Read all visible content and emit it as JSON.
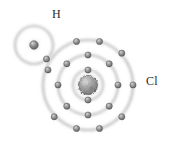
{
  "diagram": {
    "type": "bohr-model",
    "background_color": "#ffffff",
    "width": 178,
    "height": 146,
    "labels": {
      "hydrogen": "H",
      "chlorine": "Cl",
      "label_color": "#2a2a2a",
      "label_font_size": 12
    },
    "atoms": [
      {
        "id": "hydrogen",
        "symbol": "H",
        "center": {
          "x": 34,
          "y": 45
        },
        "nucleus": {
          "radius": 4.2,
          "fill": "#8e8e8e",
          "highlight": "#c9c9c9",
          "edge": "#5d5d5d"
        },
        "shells": [
          {
            "name": "K",
            "radius": 19,
            "electron_count": 1,
            "electrons": [
              {
                "x": 46.5,
                "y": 59.0,
                "shared": true
              }
            ]
          }
        ]
      },
      {
        "id": "chlorine",
        "symbol": "Cl",
        "center": {
          "x": 88,
          "y": 85
        },
        "nucleus": {
          "radius": 9.5,
          "fill": "#9a9a9a",
          "highlight": "#cfcfcf",
          "edge": "#5a5a5a"
        },
        "shells": [
          {
            "name": "K",
            "radius": 15,
            "electron_count": 2,
            "electrons": [
              {
                "x": 88,
                "y": 70,
                "shared": false
              },
              {
                "x": 88,
                "y": 100,
                "shared": false
              }
            ]
          },
          {
            "name": "L",
            "radius": 30,
            "electron_count": 8,
            "electrons": [
              {
                "x": 88,
                "y": 55,
                "shared": false
              },
              {
                "x": 109.2,
                "y": 63.8,
                "shared": false
              },
              {
                "x": 118,
                "y": 85,
                "shared": false
              },
              {
                "x": 109.2,
                "y": 106.2,
                "shared": false
              },
              {
                "x": 88,
                "y": 115,
                "shared": false
              },
              {
                "x": 66.8,
                "y": 106.2,
                "shared": false
              },
              {
                "x": 58,
                "y": 85,
                "shared": false
              },
              {
                "x": 66.8,
                "y": 63.8,
                "shared": false
              }
            ]
          },
          {
            "name": "M",
            "radius": 45,
            "electron_count": 8,
            "electrons": [
              {
                "x": 76.5,
                "y": 41.5,
                "shared": false
              },
              {
                "x": 99.5,
                "y": 41.5,
                "shared": false
              },
              {
                "x": 121.8,
                "y": 53.2,
                "shared": false
              },
              {
                "x": 133,
                "y": 85,
                "shared": false
              },
              {
                "x": 121.8,
                "y": 116.8,
                "shared": false
              },
              {
                "x": 99.5,
                "y": 128.5,
                "shared": false
              },
              {
                "x": 76.5,
                "y": 128.5,
                "shared": false
              },
              {
                "x": 54.2,
                "y": 116.8,
                "shared": false
              },
              {
                "x": 48.0,
                "y": 70.0,
                "shared": true
              },
              {
                "x": 46.5,
                "y": 59.0,
                "shared": true
              }
            ]
          }
        ]
      }
    ],
    "shell_style": {
      "stroke": "#b6b6b6",
      "stroke_width": 1.1,
      "fill": "none",
      "glow_color": "#d8d8d8"
    },
    "electron_style": {
      "radius": 3.1,
      "fill": "#8d8d8d",
      "highlight": "#cdcdcd",
      "edge": "#575757"
    },
    "bond": {
      "type": "covalent-single",
      "shared_electron_count": 2,
      "description": "overlapping H and Cl outer shells sharing one electron pair"
    }
  }
}
